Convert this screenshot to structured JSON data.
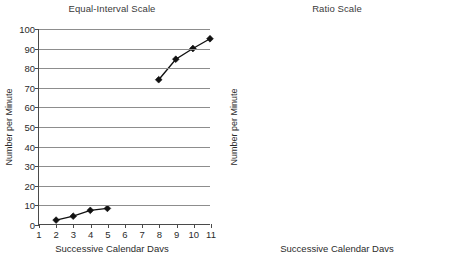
{
  "figure": {
    "background": "#ffffff",
    "ink_color": "#111111",
    "grid_color": "#8d8d8d",
    "axis_color": "#4a4a4a"
  },
  "chart_data": [
    {
      "type": "line",
      "id": "equal-interval",
      "title": "Equal-Interval Scale",
      "xlabel": "Successive Calendar Davs",
      "ylabel": "Number per Minute",
      "yscale": "linear",
      "xlim": [
        1,
        11
      ],
      "ylim": [
        0,
        100
      ],
      "xticks": [
        1,
        2,
        3,
        4,
        5,
        6,
        7,
        8,
        9,
        10,
        11
      ],
      "xtick_labels": [
        "1",
        "2",
        "3",
        "4",
        "5",
        "6",
        "7",
        "8",
        "9",
        "10",
        "11"
      ],
      "yticks": [
        0,
        10,
        20,
        30,
        40,
        50,
        60,
        70,
        80,
        90,
        100
      ],
      "ytick_labels": [
        "0",
        "10",
        "20",
        "30",
        "40",
        "50",
        "60",
        "70",
        "80",
        "90",
        "100"
      ],
      "grid": "horizontal",
      "frame": "left-bottom",
      "legend": "none",
      "marker": "diamond",
      "series": [
        {
          "name": "baseline-phase",
          "x": [
            2,
            3,
            4,
            5
          ],
          "values": [
            2,
            4,
            7,
            8
          ]
        },
        {
          "name": "treatment-phase",
          "x": [
            8,
            9,
            10,
            11
          ],
          "values": [
            74,
            84.5,
            90,
            95
          ]
        }
      ]
    },
    {
      "type": "line",
      "id": "ratio",
      "title": "Ratio Scale",
      "xlabel": "Successive Calendar Davs",
      "ylabel": "Number per Minute",
      "yscale": "log",
      "xlim": [
        1,
        11
      ],
      "ylim": [
        1,
        100
      ],
      "xticks": [
        1,
        2,
        3,
        4,
        5,
        6,
        7,
        8,
        9,
        10,
        11
      ],
      "xtick_labels": [
        "1",
        "2",
        "3",
        "4",
        "5",
        "6",
        "7",
        "8",
        "9",
        "10",
        "11"
      ],
      "yticks": [
        1,
        10,
        100
      ],
      "ytick_labels": [
        "1",
        "10",
        "100"
      ],
      "grid": "horizontal",
      "frame": "box",
      "legend": "none",
      "marker": "diamond",
      "series": [
        {
          "name": "baseline-phase",
          "x": [
            2,
            3,
            4,
            5
          ],
          "values": [
            2,
            4,
            7,
            8
          ]
        },
        {
          "name": "treatment-phase",
          "x": [
            8,
            9,
            10,
            11
          ],
          "values": [
            74,
            84.5,
            90,
            95
          ]
        }
      ]
    }
  ]
}
